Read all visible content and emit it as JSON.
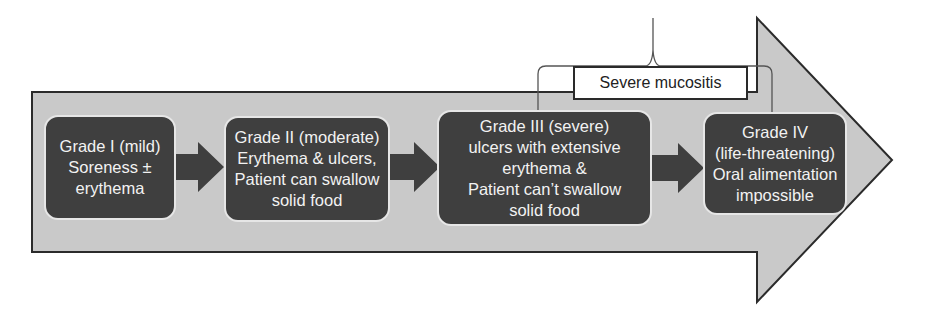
{
  "diagram": {
    "colors": {
      "big_arrow_fill": "#c9c9c9",
      "box_fill": "#3f3f3f",
      "box_text": "#f2f2f2",
      "connector_arrow": "#3f3f3f",
      "label_border": "#2a2a2a"
    },
    "grades": [
      {
        "id": "grade-1",
        "lines": [
          "Grade I (mild)",
          "Soreness ±",
          "erythema"
        ]
      },
      {
        "id": "grade-2",
        "lines": [
          "Grade II (moderate)",
          "Erythema & ulcers,",
          "Patient can swallow",
          "solid food"
        ]
      },
      {
        "id": "grade-3",
        "lines": [
          "Grade III (severe)",
          "ulcers with extensive",
          "erythema &",
          "Patient can’t swallow",
          "solid food"
        ]
      },
      {
        "id": "grade-4",
        "lines": [
          "Grade IV",
          "(life-threatening)",
          "Oral alimentation",
          "impossible"
        ]
      }
    ],
    "bracket_label": "Severe mucositis",
    "bracket_spans": [
      "grade-3",
      "grade-4"
    ]
  }
}
